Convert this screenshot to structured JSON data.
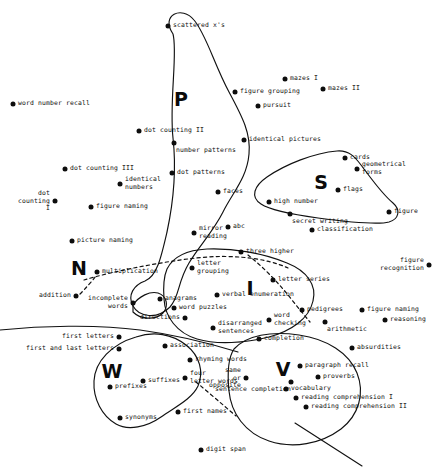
{
  "figure": {
    "type": "scatter-cluster-diagram",
    "width": 439,
    "height": 470,
    "background_color": "#ffffff",
    "ink_color": "#0d0d0d"
  },
  "cluster_letters": [
    {
      "label": "P",
      "x": 181,
      "y": 99
    },
    {
      "label": "S",
      "x": 321,
      "y": 182
    },
    {
      "label": "N",
      "x": 79,
      "y": 268
    },
    {
      "label": "I",
      "x": 250,
      "y": 288
    },
    {
      "label": "W",
      "x": 112,
      "y": 371
    },
    {
      "label": "V",
      "x": 283,
      "y": 369
    }
  ],
  "points": [
    {
      "label": "scattered x's",
      "x": 168,
      "y": 26,
      "anchor": "right"
    },
    {
      "label": "word number recall",
      "x": 13,
      "y": 104,
      "anchor": "right"
    },
    {
      "label": "mazes I",
      "x": 285,
      "y": 79,
      "anchor": "right"
    },
    {
      "label": "mazes II",
      "x": 323,
      "y": 89,
      "anchor": "right"
    },
    {
      "label": "figure grouping",
      "x": 235,
      "y": 92,
      "anchor": "right"
    },
    {
      "label": "pursuit",
      "x": 258,
      "y": 106,
      "anchor": "right"
    },
    {
      "label": "dot counting II",
      "x": 139,
      "y": 131,
      "anchor": "right"
    },
    {
      "label": "number patterns",
      "x": 174,
      "y": 143,
      "anchor": "below"
    },
    {
      "label": "identical pictures",
      "x": 244,
      "y": 140,
      "anchor": "right"
    },
    {
      "label": "dot counting III",
      "x": 65,
      "y": 169,
      "anchor": "right"
    },
    {
      "label": "identical\nnumbers",
      "x": 120,
      "y": 184,
      "anchor": "right"
    },
    {
      "label": "dot patterns",
      "x": 172,
      "y": 173,
      "anchor": "right"
    },
    {
      "label": "cards",
      "x": 345,
      "y": 158,
      "anchor": "right"
    },
    {
      "label": "geometrical\nforms",
      "x": 357,
      "y": 169,
      "anchor": "right"
    },
    {
      "label": "dot\ncounting\nI",
      "x": 55,
      "y": 201,
      "anchor": "left"
    },
    {
      "label": "figure naming",
      "x": 91,
      "y": 207,
      "anchor": "right"
    },
    {
      "label": "faces",
      "x": 218,
      "y": 192,
      "anchor": "right"
    },
    {
      "label": "flags",
      "x": 338,
      "y": 190,
      "anchor": "right"
    },
    {
      "label": "high number",
      "x": 269,
      "y": 202,
      "anchor": "right"
    },
    {
      "label": "secret writing",
      "x": 290,
      "y": 214,
      "anchor": "below"
    },
    {
      "label": "figure",
      "x": 389,
      "y": 212,
      "anchor": "right"
    },
    {
      "label": "picture naming",
      "x": 72,
      "y": 241,
      "anchor": "right"
    },
    {
      "label": "abc",
      "x": 228,
      "y": 227,
      "anchor": "right"
    },
    {
      "label": "mirror\nreading",
      "x": 194,
      "y": 233,
      "anchor": "right"
    },
    {
      "label": "classification",
      "x": 312,
      "y": 230,
      "anchor": "right"
    },
    {
      "label": "three higher",
      "x": 241,
      "y": 252,
      "anchor": "right"
    },
    {
      "label": "letter\ngrouping",
      "x": 192,
      "y": 268,
      "anchor": "right"
    },
    {
      "label": "letter series",
      "x": 273,
      "y": 280,
      "anchor": "right"
    },
    {
      "label": "figure\nrecognition",
      "x": 429,
      "y": 265,
      "anchor": "left"
    },
    {
      "label": "multiplication",
      "x": 97,
      "y": 272,
      "anchor": "right"
    },
    {
      "label": "addition",
      "x": 76,
      "y": 296,
      "anchor": "left"
    },
    {
      "label": "incomplete\nwords",
      "x": 133,
      "y": 303,
      "anchor": "left"
    },
    {
      "label": "anagrams",
      "x": 160,
      "y": 299,
      "anchor": "right"
    },
    {
      "label": "verbal enumeration",
      "x": 217,
      "y": 295,
      "anchor": "right"
    },
    {
      "label": "word puzzles",
      "x": 174,
      "y": 308,
      "anchor": "right"
    },
    {
      "label": "pedigrees",
      "x": 302,
      "y": 310,
      "anchor": "right"
    },
    {
      "label": "figure naming",
      "x": 362,
      "y": 310,
      "anchor": "right"
    },
    {
      "label": "directions",
      "x": 185,
      "y": 318,
      "anchor": "left"
    },
    {
      "label": "word\nchecking",
      "x": 269,
      "y": 320,
      "anchor": "right"
    },
    {
      "label": "arithmetic",
      "x": 325,
      "y": 322,
      "anchor": "below"
    },
    {
      "label": "reasoning",
      "x": 385,
      "y": 320,
      "anchor": "right"
    },
    {
      "label": "disarranged\nsentences",
      "x": 213,
      "y": 328,
      "anchor": "right"
    },
    {
      "label": "first letters",
      "x": 119,
      "y": 337,
      "anchor": "left"
    },
    {
      "label": "association",
      "x": 165,
      "y": 346,
      "anchor": "right"
    },
    {
      "label": "completion",
      "x": 259,
      "y": 339,
      "anchor": "right"
    },
    {
      "label": "absurdities",
      "x": 352,
      "y": 348,
      "anchor": "right"
    },
    {
      "label": "first and last letters",
      "x": 119,
      "y": 349,
      "anchor": "left"
    },
    {
      "label": "rhyming words",
      "x": 190,
      "y": 360,
      "anchor": "right"
    },
    {
      "label": "paragraph recall",
      "x": 300,
      "y": 366,
      "anchor": "right"
    },
    {
      "label": "proverbs",
      "x": 318,
      "y": 377,
      "anchor": "right"
    },
    {
      "label": "suffixes",
      "x": 143,
      "y": 381,
      "anchor": "right"
    },
    {
      "label": "four\nletter words",
      "x": 185,
      "y": 378,
      "anchor": "right"
    },
    {
      "label": "sentence completion",
      "x": 291,
      "y": 382,
      "anchor": "belowleft"
    },
    {
      "label": "same\nor\nopposite",
      "x": 246,
      "y": 378,
      "anchor": "left"
    },
    {
      "label": "prefixes",
      "x": 110,
      "y": 387,
      "anchor": "right"
    },
    {
      "label": "vocabulary",
      "x": 286,
      "y": 389,
      "anchor": "right"
    },
    {
      "label": "reading comprehension I",
      "x": 296,
      "y": 398,
      "anchor": "right"
    },
    {
      "label": "reading comprehension II",
      "x": 306,
      "y": 407,
      "anchor": "right"
    },
    {
      "label": "synonyms",
      "x": 120,
      "y": 418,
      "anchor": "right"
    },
    {
      "label": "first names",
      "x": 178,
      "y": 412,
      "anchor": "right"
    },
    {
      "label": "digit span",
      "x": 201,
      "y": 450,
      "anchor": "right"
    }
  ],
  "outlines": {
    "P_cluster": "M171,36 C158,14 180,6 192,18 C205,30 216,62 232,92 C246,118 252,132 250,152 C248,176 234,190 224,210 C214,230 200,245 190,262 C178,282 180,296 170,306 C158,318 140,316 134,306 C128,296 134,286 144,282 C156,277 160,260 166,234 C172,206 176,176 172,140 C168,104 176,54 171,36 Z",
    "S_cluster": "M259,203 C250,196 253,186 266,178 C284,167 314,154 336,152 C348,151 354,156 360,164 C370,177 380,192 392,202 C400,209 399,218 390,221 C380,224 350,222 320,218 C290,214 268,209 259,203 Z",
    "W_cluster": "M135,338 C152,332 170,334 184,345 C198,356 202,372 196,385 C190,398 174,406 160,416 C146,426 128,430 116,424 C102,417 94,400 95,382 C96,362 112,345 135,338 Z",
    "I_cluster": "M166,268 C172,256 186,250 206,249 C232,248 262,252 286,262 C306,270 316,284 312,300 C308,318 290,330 268,336 C244,342 216,344 196,338 C176,332 164,316 163,298 C162,284 163,275 166,268 Z",
    "V_cluster": "M233,348 C246,334 270,330 298,334 C326,338 348,352 356,372 C364,392 358,414 340,428 C320,443 292,448 268,440 C244,432 230,412 228,390 C226,370 227,357 233,348 Z",
    "N_blob": "M134,303 C142,295 152,292 158,294 C166,297 168,306 162,312 C154,320 140,318 134,312 Z"
  }
}
